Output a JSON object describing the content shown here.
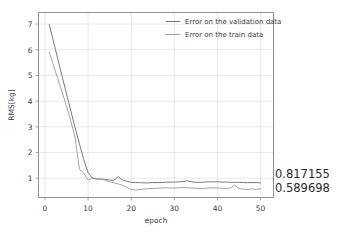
{
  "chart_data": {
    "type": "line",
    "title": "",
    "xlabel": "epoch",
    "ylabel": "RMS[kg]",
    "xlim": [
      -1.5,
      53
    ],
    "ylim": [
      0.25,
      7.45
    ],
    "xticks": [
      0,
      10,
      20,
      30,
      40,
      50
    ],
    "yticks": [
      1,
      2,
      3,
      4,
      5,
      6,
      7
    ],
    "xtick_labels": [
      "0",
      "10",
      "20",
      "30",
      "40",
      "50"
    ],
    "ytick_labels": [
      "1",
      "2",
      "3",
      "4",
      "5",
      "6",
      "7"
    ],
    "grid": true,
    "legend_position": "top-right",
    "x": [
      1,
      2,
      3,
      4,
      5,
      6,
      7,
      8,
      9,
      10,
      11,
      12,
      13,
      14,
      15,
      16,
      17,
      18,
      19,
      20,
      21,
      22,
      23,
      24,
      25,
      26,
      27,
      28,
      29,
      30,
      31,
      32,
      33,
      34,
      35,
      36,
      37,
      38,
      39,
      40,
      41,
      42,
      43,
      44,
      45,
      46,
      47,
      48,
      49,
      50
    ],
    "series": [
      {
        "name": "Error on the validation data",
        "color": "#6f7479",
        "values": [
          6.98,
          6.3,
          5.62,
          4.95,
          4.28,
          3.62,
          2.96,
          2.34,
          1.72,
          1.22,
          1.0,
          0.96,
          0.97,
          0.95,
          0.93,
          0.92,
          1.06,
          0.93,
          0.88,
          0.84,
          0.83,
          0.83,
          0.82,
          0.82,
          0.83,
          0.83,
          0.83,
          0.84,
          0.85,
          0.85,
          0.86,
          0.87,
          0.9,
          0.86,
          0.84,
          0.84,
          0.85,
          0.86,
          0.86,
          0.86,
          0.85,
          0.85,
          0.84,
          0.84,
          0.84,
          0.83,
          0.83,
          0.83,
          0.83,
          0.82
        ]
      },
      {
        "name": "Error on the train data",
        "color": "#9aa0a5",
        "values": [
          5.9,
          5.38,
          4.86,
          4.34,
          3.8,
          3.22,
          2.58,
          1.34,
          1.2,
          0.92,
          1.02,
          0.99,
          0.96,
          0.92,
          0.86,
          0.82,
          0.78,
          0.72,
          0.64,
          0.56,
          0.54,
          0.56,
          0.58,
          0.6,
          0.6,
          0.61,
          0.62,
          0.63,
          0.62,
          0.62,
          0.63,
          0.64,
          0.63,
          0.62,
          0.61,
          0.6,
          0.6,
          0.62,
          0.63,
          0.62,
          0.61,
          0.6,
          0.62,
          0.73,
          0.6,
          0.57,
          0.56,
          0.58,
          0.57,
          0.59
        ]
      }
    ],
    "annotations": [
      {
        "name": "validation-final-value",
        "text": "0.817155",
        "value": 0.817155
      },
      {
        "name": "train-final-value",
        "text": "0.589698",
        "value": 0.589698
      }
    ]
  },
  "legend": {
    "items": [
      {
        "label": "Error on the validation data"
      },
      {
        "label": "Error on the train data"
      }
    ]
  }
}
